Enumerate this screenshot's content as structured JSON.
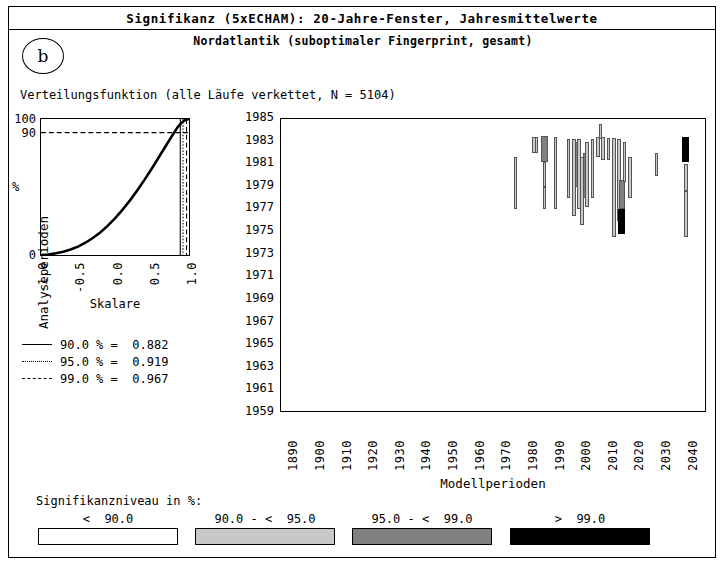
{
  "header": {
    "title": "Signifikanz (5xECHAM): 20-Jahre-Fenster, Jahresmittelwerte",
    "subtitle": "Nordatlantik (suboptimaler Fingerprint, gesamt)",
    "panel_label": "b"
  },
  "cdf_caption": "Verteilungsfunktion (alle Läufe verkettet, N = 5104)",
  "cdf_legend": [
    {
      "style": "solid",
      "text": "90.0 % =  0.882",
      "level": 90.0,
      "value": 0.882
    },
    {
      "style": "dotted",
      "text": "95.0 % =  0.919",
      "level": 95.0,
      "value": 0.919
    },
    {
      "style": "dashed",
      "text": "99.0 % =  0.967",
      "level": 99.0,
      "value": 0.967
    }
  ],
  "significance_legend": {
    "title": "Signifikanzniveau in %:",
    "items": [
      {
        "label": "<  90.0",
        "color": "#ffffff"
      },
      {
        "label": "90.0 - <  95.0",
        "color": "#c8c8c8"
      },
      {
        "label": "95.0 - <  99.0",
        "color": "#808080"
      },
      {
        "label": ">  99.0",
        "color": "#000000"
      }
    ]
  },
  "chart_data": [
    {
      "type": "line",
      "name": "cdf",
      "title": "Verteilungsfunktion (alle Läufe verkettet, N = 5104)",
      "xlabel": "Skalare",
      "ylabel": "%",
      "xlim": [
        -1.0,
        1.0
      ],
      "ylim": [
        0,
        100
      ],
      "xticks": [
        "-1.0",
        "-0.5",
        "0.0",
        "0.5",
        "1.0"
      ],
      "yticks": [
        "0",
        "90",
        "100"
      ],
      "grid": false,
      "x": [
        -1.0,
        -0.9,
        -0.8,
        -0.7,
        -0.6,
        -0.5,
        -0.4,
        -0.3,
        -0.2,
        -0.1,
        0.0,
        0.1,
        0.2,
        0.3,
        0.4,
        0.5,
        0.6,
        0.7,
        0.8,
        0.85,
        0.9,
        0.95,
        1.0
      ],
      "values": [
        0,
        0.4,
        1.2,
        2.4,
        4.0,
        6.2,
        9.0,
        12.5,
        16.6,
        21.4,
        27.0,
        33.2,
        40.0,
        47.4,
        55.4,
        63.8,
        72.6,
        81.4,
        90.2,
        94.2,
        97.2,
        99.2,
        100
      ],
      "annotations": [
        {
          "kind": "hline",
          "y": 90,
          "style": "dashed"
        },
        {
          "kind": "vline",
          "x": 0.882,
          "style": "solid",
          "label": "90.0 %"
        },
        {
          "kind": "vline",
          "x": 0.919,
          "style": "dotted",
          "label": "95.0 %"
        },
        {
          "kind": "vline",
          "x": 0.967,
          "style": "dashed",
          "label": "99.0 %"
        }
      ]
    },
    {
      "type": "heatmap",
      "name": "significance-map",
      "xlabel": "Modellperioden",
      "ylabel": "Analyseperioden",
      "xlim": [
        1885,
        2045
      ],
      "ylim": [
        1959,
        1985
      ],
      "xticks": [
        "1890",
        "1900",
        "1910",
        "1920",
        "1930",
        "1940",
        "1950",
        "1960",
        "1970",
        "1980",
        "1990",
        "2000",
        "2010",
        "2020",
        "2030",
        "2040"
      ],
      "yticks": [
        "1959",
        "1961",
        "1963",
        "1965",
        "1967",
        "1969",
        "1971",
        "1973",
        "1975",
        "1977",
        "1979",
        "1981",
        "1983",
        "1985"
      ],
      "grid": false,
      "colors": {
        "white": "#ffffff",
        "light": "#c8c8c8",
        "medium": "#808080",
        "black": "#000000"
      },
      "cells": [
        {
          "x": 1973,
          "y0": 1977.0,
          "y1": 1981.6,
          "w": 1.2,
          "shade": "light"
        },
        {
          "x": 1980,
          "y0": 1982.0,
          "y1": 1983.4,
          "w": 1.3,
          "shade": "light"
        },
        {
          "x": 1981,
          "y0": 1982.0,
          "y1": 1983.4,
          "w": 1.3,
          "shade": "light"
        },
        {
          "x": 1984,
          "y0": 1981.2,
          "y1": 1983.5,
          "w": 2.6,
          "shade": "medium"
        },
        {
          "x": 1984,
          "y0": 1979.0,
          "y1": 1981.2,
          "w": 1.4,
          "shade": "light"
        },
        {
          "x": 1984,
          "y0": 1977.0,
          "y1": 1979.0,
          "w": 1.2,
          "shade": "light"
        },
        {
          "x": 1988,
          "y0": 1977.0,
          "y1": 1983.4,
          "w": 1.2,
          "shade": "light"
        },
        {
          "x": 1993,
          "y0": 1978.0,
          "y1": 1983.2,
          "w": 1.2,
          "shade": "light"
        },
        {
          "x": 1995,
          "y0": 1976.4,
          "y1": 1983.2,
          "w": 1.3,
          "shade": "light"
        },
        {
          "x": 1996,
          "y0": 1979.0,
          "y1": 1983.0,
          "w": 1.4,
          "shade": "medium"
        },
        {
          "x": 1997,
          "y0": 1977.0,
          "y1": 1983.2,
          "w": 1.3,
          "shade": "light"
        },
        {
          "x": 1998,
          "y0": 1975.6,
          "y1": 1981.6,
          "w": 1.4,
          "shade": "light"
        },
        {
          "x": 1999,
          "y0": 1978.0,
          "y1": 1982.0,
          "w": 1.5,
          "shade": "medium"
        },
        {
          "x": 2000,
          "y0": 1977.2,
          "y1": 1983.0,
          "w": 1.3,
          "shade": "light"
        },
        {
          "x": 2002,
          "y0": 1978.0,
          "y1": 1983.2,
          "w": 1.4,
          "shade": "light"
        },
        {
          "x": 2004,
          "y0": 1981.6,
          "y1": 1983.4,
          "w": 1.3,
          "shade": "light"
        },
        {
          "x": 2005,
          "y0": 1983.2,
          "y1": 1984.6,
          "w": 1.3,
          "shade": "light"
        },
        {
          "x": 2006,
          "y0": 1981.4,
          "y1": 1983.4,
          "w": 1.3,
          "shade": "light"
        },
        {
          "x": 2008,
          "y0": 1981.4,
          "y1": 1983.3,
          "w": 1.4,
          "shade": "light"
        },
        {
          "x": 2010,
          "y0": 1974.6,
          "y1": 1983.3,
          "w": 1.4,
          "shade": "light"
        },
        {
          "x": 2012,
          "y0": 1976.0,
          "y1": 1983.2,
          "w": 1.5,
          "shade": "light"
        },
        {
          "x": 2013,
          "y0": 1977.0,
          "y1": 1979.6,
          "w": 2.4,
          "shade": "medium"
        },
        {
          "x": 2013,
          "y0": 1974.8,
          "y1": 1977.0,
          "w": 2.6,
          "shade": "black"
        },
        {
          "x": 2014,
          "y0": 1979.4,
          "y1": 1983.0,
          "w": 1.3,
          "shade": "light"
        },
        {
          "x": 2016,
          "y0": 1978.0,
          "y1": 1981.6,
          "w": 1.3,
          "shade": "light"
        },
        {
          "x": 2026,
          "y0": 1980.0,
          "y1": 1982.0,
          "w": 1.1,
          "shade": "light"
        },
        {
          "x": 2037,
          "y0": 1981.2,
          "y1": 1983.4,
          "w": 2.6,
          "shade": "black"
        },
        {
          "x": 2037,
          "y0": 1978.6,
          "y1": 1981.0,
          "w": 1.6,
          "shade": "light"
        },
        {
          "x": 2037,
          "y0": 1974.6,
          "y1": 1978.6,
          "w": 1.4,
          "shade": "light"
        }
      ]
    }
  ]
}
